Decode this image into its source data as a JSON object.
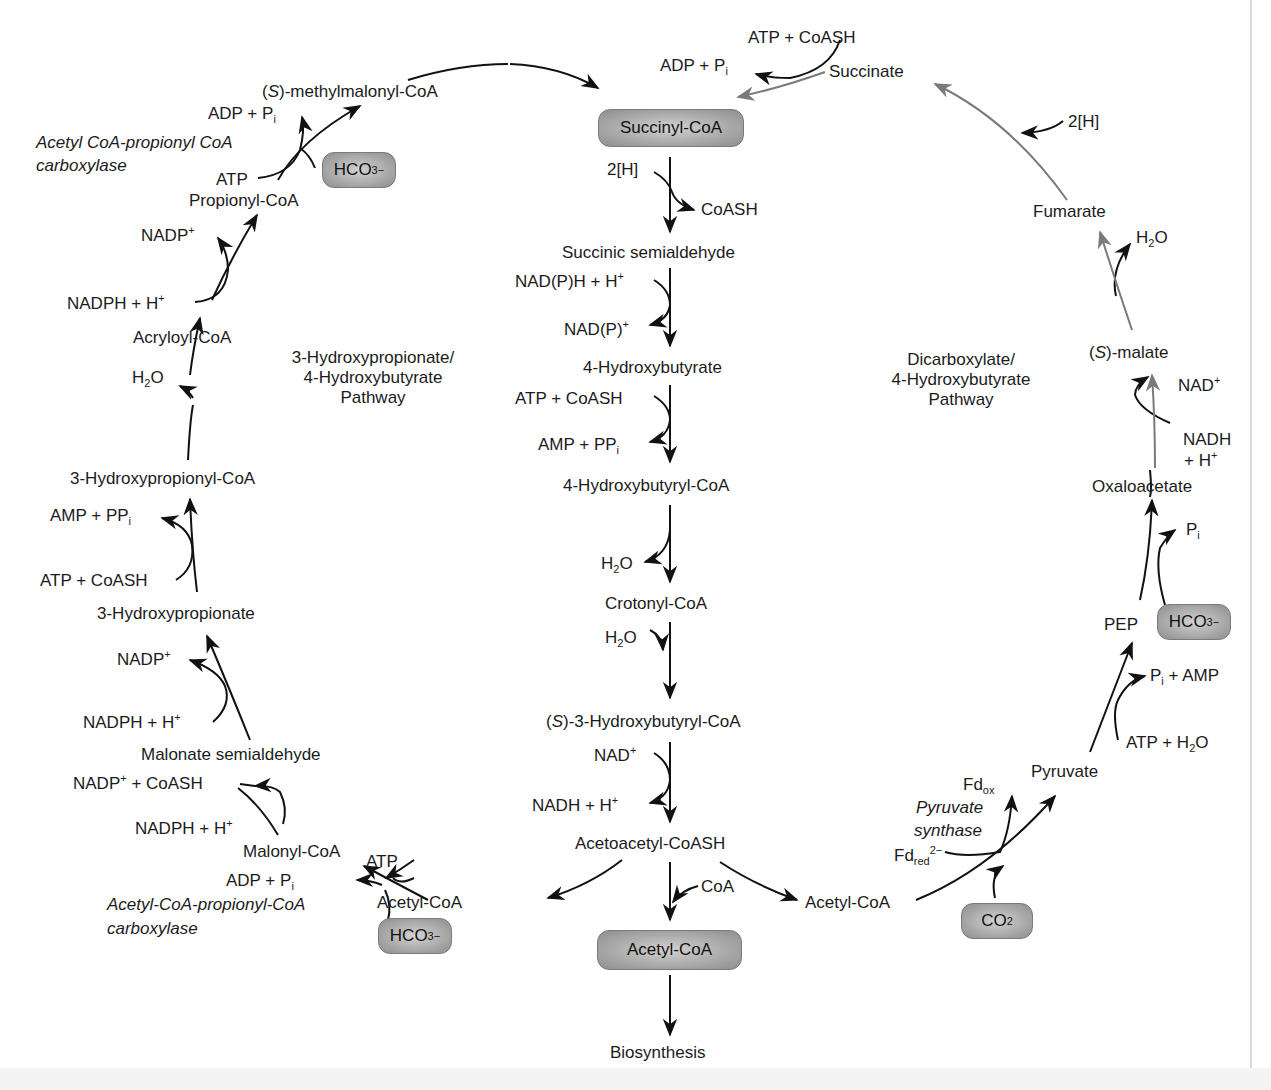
{
  "diagram": {
    "title_left": {
      "line1": "3-Hydroxypropionate/",
      "line2": "4-Hydroxybutyrate",
      "line3": "Pathway"
    },
    "title_right": {
      "line1": "Dicarboxylate/",
      "line2": "4-Hydroxybutyrate",
      "line3": "Pathway"
    },
    "key_boxes": {
      "succinyl_coa": "Succinyl-CoA",
      "acetyl_coa": "Acetyl-CoA",
      "hco3_top_left": {
        "base": "HCO",
        "sub": "3",
        "sup": "−"
      },
      "hco3_bottom_left": {
        "base": "HCO",
        "sub": "3",
        "sup": "−"
      },
      "hco3_right": {
        "base": "HCO",
        "sub": "3",
        "sup": "−"
      },
      "co2": {
        "base": "CO",
        "sub": "2"
      }
    },
    "central_column": {
      "cofactor_2h": "2[H]",
      "coash_out": "CoASH",
      "succinic_semialdehyde": "Succinic semialdehyde",
      "nadph_in": {
        "base": "NAD(P)H + H",
        "sup": "+"
      },
      "nadp_out": {
        "base": "NAD(P)",
        "sup": "+"
      },
      "hydroxybutyrate": "4-Hydroxybutyrate",
      "atp_coash_in": "ATP + CoASH",
      "amp_ppi_out": {
        "base": "AMP + PP",
        "sub": "i"
      },
      "hydroxybutyryl_coa": "4-Hydroxybutyryl-CoA",
      "h2o_out": {
        "base": "H",
        "sub": "2",
        "tail": "O"
      },
      "crotonyl_coa": "Crotonyl-CoA",
      "h2o_in": {
        "base": "H",
        "sub": "2",
        "tail": "O"
      },
      "s3_hydroxybutyryl_coa": {
        "prefix": "S",
        "text": "-3-Hydroxybutyryl-CoA"
      },
      "nad_in": {
        "base": "NAD",
        "sup": "+"
      },
      "nadh_out": {
        "base": "NADH + H",
        "sup": "+"
      },
      "acetoacetyl_coash": "Acetoacetyl-CoASH",
      "coa_in": "CoA",
      "biosynthesis": "Biosynthesis"
    },
    "left_arc": {
      "methylmalonyl_coa": {
        "prefix": "S",
        "text": "-methylmalonyl-CoA"
      },
      "adp_pi_top": {
        "base": "ADP + P",
        "sub": "i"
      },
      "enzyme_top_line1": "Acetyl CoA-propionyl CoA",
      "enzyme_top_line2": "carboxylase",
      "atp_top": "ATP",
      "propionyl_coa": "Propionyl-CoA",
      "nadp_1": {
        "base": "NADP",
        "sup": "+"
      },
      "nadph_1": {
        "base": "NADPH + H",
        "sup": "+"
      },
      "acryloyl_coa": "Acryloyl-CoA",
      "h2o": {
        "base": "H",
        "sub": "2",
        "tail": "O"
      },
      "hydroxypropionyl_coa": "3-Hydroxypropionyl-CoA",
      "amp_ppi": {
        "base": "AMP + PP",
        "sub": "i"
      },
      "atp_coash": "ATP + CoASH",
      "hydroxypropionate": "3-Hydroxypropionate",
      "nadp_2": {
        "base": "NADP",
        "sup": "+"
      },
      "nadph_2": {
        "base": "NADPH + H",
        "sup": "+"
      },
      "malonate_semialdehyde": "Malonate semialdehyde",
      "nadp_coash": {
        "base": "NADP",
        "sup": "+",
        "tail": " + CoASH"
      },
      "nadph_3": {
        "base": "NADPH + H",
        "sup": "+"
      },
      "malonyl_coa": "Malonyl-CoA",
      "atp_bottom": "ATP",
      "adp_pi_bottom": {
        "base": "ADP + P",
        "sub": "i"
      },
      "enzyme_bottom_line1": "Acetyl-CoA-propionyl-CoA",
      "enzyme_bottom_line2": "carboxylase",
      "acetyl_coa_left": "Acetyl-CoA"
    },
    "right_arc": {
      "atp_coash_top": "ATP + CoASH",
      "adp_pi_top": {
        "base": "ADP + P",
        "sub": "i"
      },
      "succinate": "Succinate",
      "cofactor_2h": "2[H]",
      "fumarate": "Fumarate",
      "h2o": {
        "base": "H",
        "sub": "2",
        "tail": "O"
      },
      "s_malate": {
        "prefix": "S",
        "text": "-malate"
      },
      "nad": {
        "base": "NAD",
        "sup": "+"
      },
      "nadh_line1": "NADH",
      "nadh_line2": {
        "base": "+ H",
        "sup": "+"
      },
      "oxaloacetate": "Oxaloacetate",
      "pi": {
        "base": "P",
        "sub": "i"
      },
      "pep": "PEP",
      "pi_amp": {
        "base": "P",
        "sub": "i",
        "tail": " + AMP"
      },
      "atp_h2o": {
        "base": "ATP + H",
        "sub": "2",
        "tail": "O"
      },
      "pyruvate": "Pyruvate",
      "fd_ox": {
        "base": "Fd",
        "sub": "ox"
      },
      "enzyme_line1": "Pyruvate",
      "enzyme_line2": "synthase",
      "fd_red": {
        "base": "Fd",
        "sub": "red",
        "sup": "2−"
      },
      "acetyl_coa_right": "Acetyl-CoA"
    },
    "colors": {
      "arrow_black": "#111111",
      "arrow_gray": "#7a7a7a",
      "box_fill": "#a8a8a8",
      "text": "#1b1b1b"
    }
  }
}
